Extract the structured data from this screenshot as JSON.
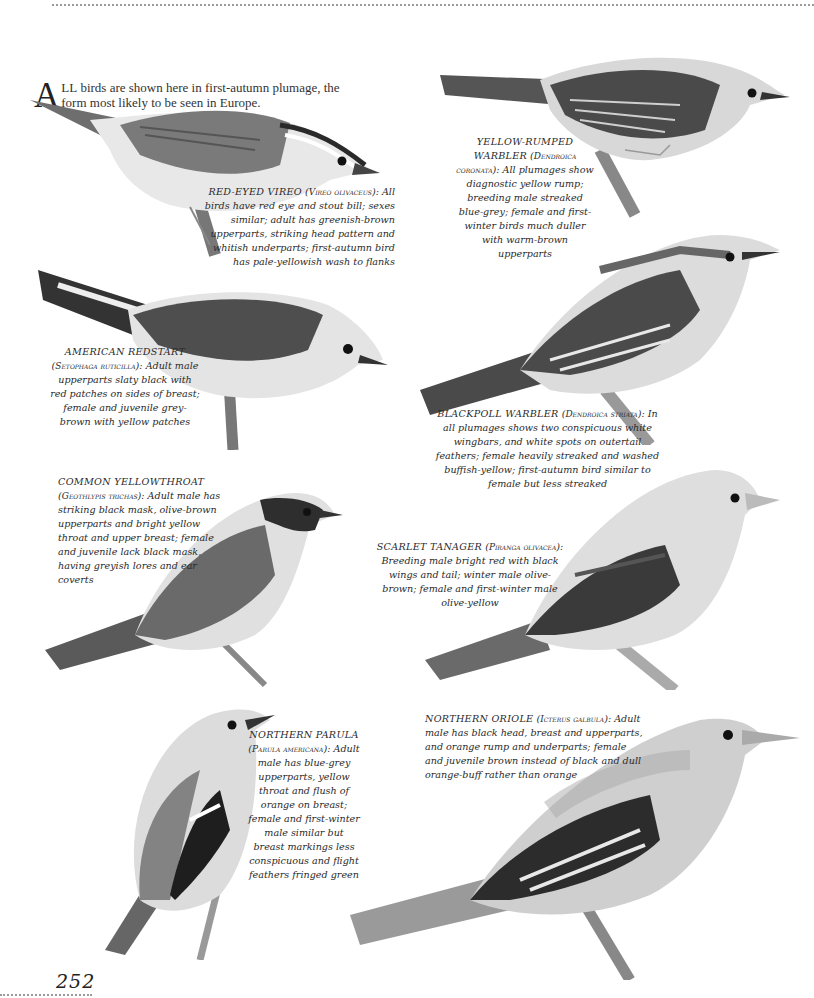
{
  "page": {
    "number": "252",
    "intro": {
      "drop_cap": "A",
      "smallcaps": "LL",
      "text": " birds are shown here in first-autumn plumage, the form most likely to be seen in Europe."
    }
  },
  "species": [
    {
      "id": "red-eyed-vireo",
      "name": "RED-EYED VIREO",
      "scientific": "Vireo olivaceus",
      "description": "All birds have red eye and stout bill; sexes similar; adult has greenish-brown upperparts, striking head pattern and whitish underparts; first-autumn bird has pale-yellowish wash to flanks"
    },
    {
      "id": "yellow-rumped-warbler",
      "name": "YELLOW-RUMPED WARBLER",
      "scientific": "Dendroica coronata",
      "description": "All plumages show diagnostic yellow rump; breeding male streaked blue-grey; female and first-winter birds much duller with warm-brown upperparts"
    },
    {
      "id": "american-redstart",
      "name": "AMERICAN REDSTART",
      "scientific": "Setophaga ruticilla",
      "description": "Adult male upperparts slaty black with red patches on sides of breast; female and juvenile grey-brown with yellow patches"
    },
    {
      "id": "blackpoll-warbler",
      "name": "BLACKPOLL WARBLER",
      "scientific": "Dendroica striata",
      "description": "In all plumages shows two conspicuous white wingbars, and white spots on outertail feathers; female heavily streaked and washed buffish-yellow; first-autumn bird similar to female but less streaked"
    },
    {
      "id": "common-yellowthroat",
      "name": "COMMON YELLOWTHROAT",
      "scientific": "Geothlypis trichas",
      "description": "Adult male has striking black mask, olive-brown upperparts and bright yellow throat and upper breast; female and juvenile lack black mask, having greyish lores and ear coverts"
    },
    {
      "id": "scarlet-tanager",
      "name": "SCARLET TANAGER",
      "scientific": "Piranga olivacea",
      "description": "Breeding male bright red with black wings and tail; winter male olive-brown; female and first-winter male olive-yellow"
    },
    {
      "id": "northern-parula",
      "name": "NORTHERN PARULA",
      "scientific": "Parula americana",
      "description": "Adult male has blue-grey upperparts, yellow throat and flush of orange on breast; female and first-winter male similar but breast markings less conspicuous and flight feathers fringed green"
    },
    {
      "id": "northern-oriole",
      "name": "NORTHERN ORIOLE",
      "scientific": "Icterus galbula",
      "description": "Adult male has black head, breast and upperparts, and orange rump and underparts; female and juvenile brown instead of black and dull orange-buff rather than orange"
    }
  ],
  "colors": {
    "ink": "#2a2a2a",
    "rule": "#9a9a9a",
    "plumage_dark": "#3a3a3a",
    "plumage_mid": "#7d7d7d",
    "plumage_light": "#d6d6d6",
    "branch": "#8a8a8a"
  }
}
